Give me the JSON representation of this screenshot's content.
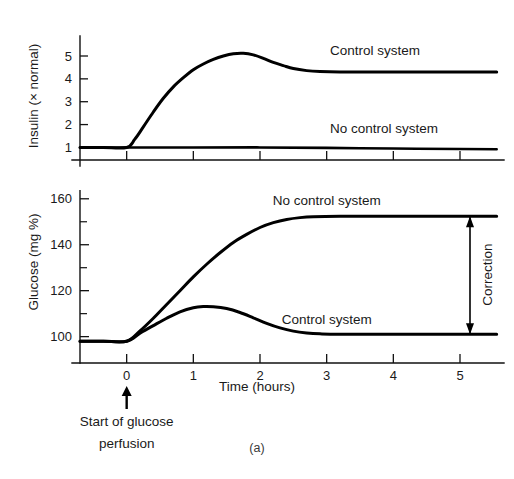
{
  "figure": {
    "caption": "(a)",
    "background_color": "#ffffff",
    "ink_color": "#000000"
  },
  "chart_data": [
    {
      "type": "line",
      "panel": "insulin",
      "title": "",
      "xlabel": "",
      "ylabel": "Insulin (× normal)",
      "xlim": [
        -0.7,
        5.6
      ],
      "ylim": [
        0.45,
        5.7
      ],
      "grid": false,
      "legend_position": "inline-right",
      "xticks": [
        0,
        1,
        2,
        3,
        4,
        5
      ],
      "xticklabels": [
        "",
        "",
        "",
        "",
        "",
        ""
      ],
      "yticks": [
        1,
        2,
        3,
        4,
        5
      ],
      "yticklabels": [
        "1",
        "2",
        "3",
        "4",
        "5"
      ],
      "series": [
        {
          "name": "Control system",
          "label": "Control system",
          "label_x": 3.05,
          "label_y": 5.05,
          "points": [
            [
              -0.7,
              1.0
            ],
            [
              -0.35,
              1.0
            ],
            [
              0.0,
              1.0
            ],
            [
              0.12,
              1.35
            ],
            [
              0.25,
              1.9
            ],
            [
              0.4,
              2.55
            ],
            [
              0.55,
              3.15
            ],
            [
              0.7,
              3.65
            ],
            [
              0.85,
              4.05
            ],
            [
              1.0,
              4.4
            ],
            [
              1.15,
              4.65
            ],
            [
              1.3,
              4.85
            ],
            [
              1.45,
              5.0
            ],
            [
              1.6,
              5.1
            ],
            [
              1.75,
              5.12
            ],
            [
              1.9,
              5.05
            ],
            [
              2.05,
              4.9
            ],
            [
              2.2,
              4.72
            ],
            [
              2.35,
              4.58
            ],
            [
              2.5,
              4.45
            ],
            [
              2.7,
              4.36
            ],
            [
              2.9,
              4.32
            ],
            [
              3.2,
              4.3
            ],
            [
              3.8,
              4.3
            ],
            [
              4.5,
              4.3
            ],
            [
              5.2,
              4.3
            ],
            [
              5.55,
              4.3
            ]
          ]
        },
        {
          "name": "No control system",
          "label": "No control system",
          "label_x": 3.05,
          "label_y": 1.62,
          "points": [
            [
              -0.7,
              1.0
            ],
            [
              0.0,
              1.0
            ],
            [
              1.0,
              1.0
            ],
            [
              2.0,
              1.0
            ],
            [
              3.0,
              0.98
            ],
            [
              4.0,
              0.95
            ],
            [
              5.0,
              0.93
            ],
            [
              5.55,
              0.92
            ]
          ]
        }
      ]
    },
    {
      "type": "line",
      "panel": "glucose",
      "title": "",
      "xlabel": "Time (hours)",
      "ylabel": "Glucose (mg %)",
      "xlim": [
        -0.7,
        5.6
      ],
      "ylim": [
        92,
        166
      ],
      "grid": false,
      "legend_position": "inline-right",
      "xticks": [
        0,
        1,
        2,
        3,
        4,
        5
      ],
      "xticklabels": [
        "0",
        "1",
        "2",
        "3",
        "4",
        "5"
      ],
      "yticks": [
        100,
        120,
        140,
        160
      ],
      "yticklabels": [
        "100",
        "120",
        "140",
        "160"
      ],
      "yticks_minor": [
        110,
        130,
        150
      ],
      "series": [
        {
          "name": "No control system",
          "label": "No control system",
          "label_x": 3.0,
          "label_y": 157.5,
          "points": [
            [
              -0.7,
              98.0
            ],
            [
              -0.35,
              98.0
            ],
            [
              0.0,
              98.0
            ],
            [
              0.2,
              102.5
            ],
            [
              0.4,
              108.0
            ],
            [
              0.6,
              114.0
            ],
            [
              0.8,
              120.0
            ],
            [
              1.0,
              126.0
            ],
            [
              1.2,
              131.5
            ],
            [
              1.4,
              136.5
            ],
            [
              1.6,
              141.0
            ],
            [
              1.8,
              144.5
            ],
            [
              2.0,
              147.5
            ],
            [
              2.2,
              149.6
            ],
            [
              2.4,
              151.0
            ],
            [
              2.6,
              151.8
            ],
            [
              2.8,
              152.2
            ],
            [
              3.2,
              152.4
            ],
            [
              4.0,
              152.4
            ],
            [
              4.8,
              152.4
            ],
            [
              5.55,
              152.4
            ]
          ]
        },
        {
          "name": "Control system",
          "label": "Control system",
          "label_x": 3.0,
          "label_y": 105.5,
          "points": [
            [
              -0.7,
              98.0
            ],
            [
              -0.35,
              98.0
            ],
            [
              0.0,
              98.0
            ],
            [
              0.2,
              101.5
            ],
            [
              0.4,
              104.8
            ],
            [
              0.6,
              108.0
            ],
            [
              0.8,
              110.8
            ],
            [
              1.0,
              112.6
            ],
            [
              1.15,
              113.1
            ],
            [
              1.3,
              113.0
            ],
            [
              1.5,
              112.2
            ],
            [
              1.7,
              110.5
            ],
            [
              1.9,
              108.2
            ],
            [
              2.1,
              105.8
            ],
            [
              2.3,
              103.8
            ],
            [
              2.5,
              102.4
            ],
            [
              2.7,
              101.6
            ],
            [
              2.9,
              101.2
            ],
            [
              3.2,
              101.0
            ],
            [
              4.0,
              101.0
            ],
            [
              4.8,
              101.0
            ],
            [
              5.55,
              101.0
            ]
          ]
        }
      ],
      "annotations": [
        {
          "name": "correction-bracket",
          "label": "Correction",
          "kind": "double-ended-measure",
          "x": 5.15,
          "y_top": 152.4,
          "y_bottom": 101.0,
          "label_x": 5.42,
          "label_y": 127.0
        },
        {
          "name": "start-of-glucose-perfusion",
          "label_line_1": "Start of glucose",
          "label_line_2": "perfusion",
          "kind": "up-arrow-annotation",
          "x": 0
        }
      ]
    }
  ],
  "axis_titles": {
    "insulin": "Insulin (× normal)",
    "glucose": "Glucose (mg %)",
    "time": "Time (hours)"
  },
  "labels": {
    "insulin_control": "Control system",
    "insulin_no_control": "No control system",
    "glucose_no_control": "No control system",
    "glucose_control": "Control system",
    "correction": "Correction",
    "start_line_1": "Start of glucose",
    "start_line_2": "perfusion",
    "caption": "(a)"
  }
}
